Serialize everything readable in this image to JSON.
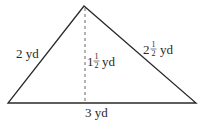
{
  "diagram": {
    "shape": "triangle",
    "vertices": {
      "apex": [
        84,
        6
      ],
      "bottom_left": [
        8,
        103
      ],
      "bottom_right": [
        196,
        103
      ]
    },
    "altitude": {
      "x": 85,
      "y_top": 8,
      "y_bottom": 103,
      "style": "dashed"
    },
    "colors": {
      "stroke": "#2a2a2a",
      "background": "#ffffff"
    },
    "labels": {
      "left_side": {
        "whole": "2",
        "unit": "yd"
      },
      "height": {
        "whole": "1",
        "num": "1",
        "den": "2",
        "unit": "yd"
      },
      "right_side": {
        "whole": "2",
        "num": "1",
        "den": "2",
        "unit": "yd"
      },
      "base": {
        "whole": "3",
        "unit": "yd"
      }
    }
  }
}
